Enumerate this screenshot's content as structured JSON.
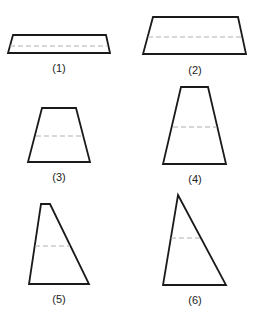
{
  "figure": {
    "stroke_color": "#1a1a1a",
    "dash_color": "#b0b0b0",
    "shapes": [
      {
        "label": "(1)",
        "points": "13,35 106,35 110,53 8,53",
        "dash": {
          "x1": 10,
          "x2": 108,
          "y": 46
        },
        "label_x": 59,
        "label_y": 62
      },
      {
        "label": "(2)",
        "points": "153,17 238,17 246,54 143,54",
        "dash": {
          "x1": 148,
          "x2": 242,
          "y": 37
        },
        "label_x": 195,
        "label_y": 64
      },
      {
        "label": "(3)",
        "points": "42,108 76,108 90,162 28,162",
        "dash": {
          "x1": 36,
          "x2": 83,
          "y": 136
        },
        "label_x": 59,
        "label_y": 171
      },
      {
        "label": "(4)",
        "points": "181,87 208,87 226,164 163,164",
        "dash": {
          "x1": 173,
          "x2": 217,
          "y": 127
        },
        "label_x": 195,
        "label_y": 173
      },
      {
        "label": "(5)",
        "points": "41,204 50,204 89,284 29,284",
        "dash": {
          "x1": 35,
          "x2": 70,
          "y": 246
        },
        "label_x": 59,
        "label_y": 293
      },
      {
        "label": "(6)",
        "points": "178,195 178,195 226,285 163,285",
        "dash": {
          "x1": 171,
          "x2": 200,
          "y": 238
        },
        "label_x": 195,
        "label_y": 294
      }
    ]
  }
}
